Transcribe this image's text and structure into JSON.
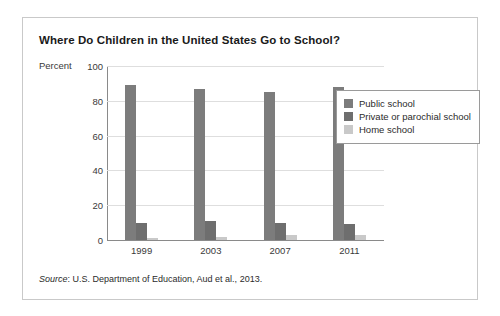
{
  "figure": {
    "title": "Where Do Children in the United States Go to School?",
    "source_word": "Source",
    "source_text": ": U.S. Department of Education, Aud et al., 2013."
  },
  "colors": {
    "public_school": "#7c7c7c",
    "private_school": "#6e6e6e",
    "home_school": "#c9c9c9",
    "axis": "#8a8a8a",
    "grid": "#dedede",
    "border": "#c9c9c9",
    "text": "#231f20"
  },
  "chart_data": {
    "type": "bar",
    "title": "Where Do Children in the United States Go to School?",
    "xlabel": "",
    "ylabel": "Percent",
    "ylim": [
      0,
      100
    ],
    "yticks": [
      0,
      20,
      40,
      60,
      80,
      100
    ],
    "grid": true,
    "legend_position": "upper right",
    "categories": [
      "1999",
      "2003",
      "2007",
      "2011"
    ],
    "series": [
      {
        "name": "Public school",
        "color": "#7c7c7c",
        "values": [
          89,
          87,
          85,
          88
        ]
      },
      {
        "name": "Private or parochial school",
        "color": "#6e6e6e",
        "values": [
          10,
          11,
          10,
          9
        ]
      },
      {
        "name": "Home school",
        "color": "#c9c9c9",
        "values": [
          1,
          2,
          3,
          3
        ]
      }
    ]
  }
}
